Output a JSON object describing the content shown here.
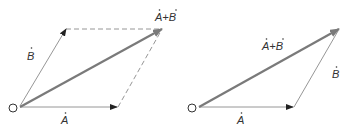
{
  "colors": {
    "thin_vector": "#8a8a8a",
    "sum_vector": "#7a7a7a",
    "dashed": "#8a8a8a",
    "text": "#333333",
    "arrowhead": "#222222"
  },
  "left_diagram": {
    "title": "Parallelogram rule",
    "origin_label": "O",
    "vector_a_label": "A",
    "vector_b_label": "B",
    "sum_label": "A+B",
    "dot_marker": "˙"
  },
  "right_diagram": {
    "title": "Triangle rule",
    "origin_label": "O",
    "vector_a_label": "A",
    "vector_b_label": "B",
    "sum_label": "A+B",
    "dot_marker": "˙"
  }
}
